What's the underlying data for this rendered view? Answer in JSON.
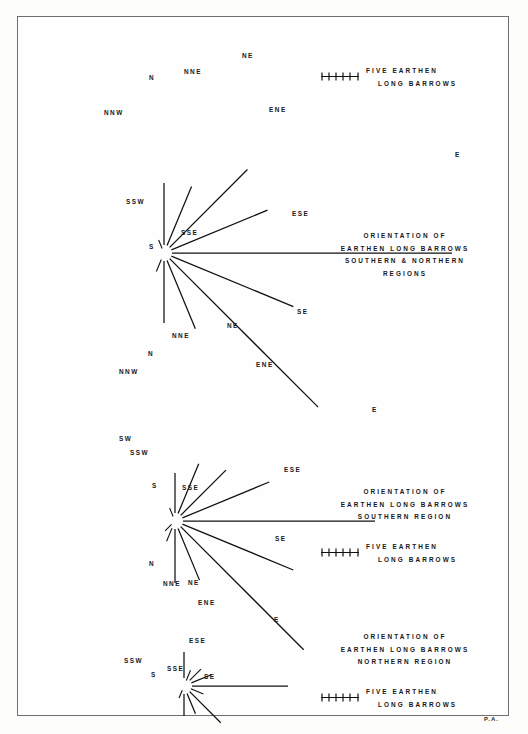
{
  "figure": {
    "signature": "P.A.",
    "compass_order": [
      "NNW",
      "N",
      "NNE",
      "NE",
      "ENE",
      "E",
      "ESE",
      "SE",
      "SSE",
      "S",
      "SSW",
      "SW"
    ]
  },
  "legend_scale": {
    "ticks": 6,
    "line1": "FIVE  EARTHEN",
    "line2": "LONG BARROWS"
  },
  "panels": [
    {
      "id": "combined",
      "title_lines": [
        "ORIENTATION  OF",
        "EARTHEN  LONG  BARROWS",
        "SOUTHERN  &  NORTHERN",
        "REGIONS"
      ],
      "labels": [
        "NNW",
        "N",
        "NNE",
        "NE",
        "ENE",
        "E",
        "ESE",
        "SE",
        "SSE",
        "S",
        "SSW"
      ],
      "rays": [
        {
          "label": "NNW",
          "azimuth": -22.5,
          "length": 14
        },
        {
          "label": "N",
          "azimuth": 0,
          "length": 70
        },
        {
          "label": "NNE",
          "azimuth": 22.5,
          "length": 72
        },
        {
          "label": "NE",
          "azimuth": 45,
          "length": 118
        },
        {
          "label": "ENE",
          "azimuth": 67.5,
          "length": 112
        },
        {
          "label": "E",
          "azimuth": 90,
          "length": 288
        },
        {
          "label": "ESE",
          "azimuth": 112.5,
          "length": 140
        },
        {
          "label": "SE",
          "azimuth": 135,
          "length": 218
        },
        {
          "label": "SSE",
          "azimuth": 157.5,
          "length": 82
        },
        {
          "label": "S",
          "azimuth": 180,
          "length": 70
        },
        {
          "label": "SSW",
          "azimuth": 202.5,
          "length": 20
        }
      ]
    },
    {
      "id": "southern",
      "title_lines": [
        "ORIENTATION  OF",
        "EARTHEN  LONG  BARROWS",
        "SOUTHERN  REGION"
      ],
      "labels": [
        "NNW",
        "N",
        "NNE",
        "NE",
        "ENE",
        "E",
        "ESE",
        "SE",
        "SSE",
        "S",
        "SSW",
        "SW"
      ],
      "rays": [
        {
          "label": "NNW",
          "azimuth": -22.5,
          "length": 14
        },
        {
          "label": "N",
          "azimuth": 0,
          "length": 48
        },
        {
          "label": "NNE",
          "azimuth": 22.5,
          "length": 62
        },
        {
          "label": "NE",
          "azimuth": 45,
          "length": 72
        },
        {
          "label": "ENE",
          "azimuth": 67.5,
          "length": 102
        },
        {
          "label": "E",
          "azimuth": 90,
          "length": 200
        },
        {
          "label": "ESE",
          "azimuth": 112.5,
          "length": 128
        },
        {
          "label": "SE",
          "azimuth": 135,
          "length": 182
        },
        {
          "label": "SSE",
          "azimuth": 157.5,
          "length": 64
        },
        {
          "label": "S",
          "azimuth": 180,
          "length": 62
        },
        {
          "label": "SSW",
          "azimuth": 202.5,
          "length": 22
        },
        {
          "label": "SW",
          "azimuth": 225,
          "length": 14
        }
      ]
    },
    {
      "id": "northern",
      "title_lines": [
        "ORIENTATION  OF",
        "EARTHEN  LONG  BARROWS",
        "NORTHERN  REGION"
      ],
      "labels": [
        "N",
        "NNE",
        "NE",
        "ENE",
        "E",
        "ESE",
        "SE",
        "SSE",
        "S",
        "SSW"
      ],
      "rays": [
        {
          "label": "N",
          "azimuth": 0,
          "length": 34
        },
        {
          "label": "NNE",
          "azimuth": 22.5,
          "length": 17
        },
        {
          "label": "NE",
          "azimuth": 45,
          "length": 24
        },
        {
          "label": "ENE",
          "azimuth": 67.5,
          "length": 30
        },
        {
          "label": "E",
          "azimuth": 90,
          "length": 104
        },
        {
          "label": "ESE",
          "azimuth": 112.5,
          "length": 21
        },
        {
          "label": "SE",
          "azimuth": 135,
          "length": 52
        },
        {
          "label": "SSE",
          "azimuth": 157.5,
          "length": 30
        },
        {
          "label": "S",
          "azimuth": 180,
          "length": 30
        },
        {
          "label": "SSW",
          "azimuth": 202.5,
          "length": 13
        }
      ]
    }
  ],
  "text": {
    "p1_title1": "ORIENTATION  OF",
    "p1_title2": "EARTHEN  LONG  BARROWS",
    "p1_title3": "SOUTHERN  &  NORTHERN",
    "p1_title4": "REGIONS",
    "p2_title1": "ORIENTATION  OF",
    "p2_title2": "EARTHEN  LONG  BARROWS",
    "p2_title3": "SOUTHERN  REGION",
    "p3_title1": "ORIENTATION  OF",
    "p3_title2": "EARTHEN  LONG  BARROWS",
    "p3_title3": "NORTHERN  REGION",
    "leg1a": "FIVE  EARTHEN",
    "leg1b": "LONG BARROWS",
    "leg2a": "FIVE  EARTHEN",
    "leg2b": "LONG BARROWS",
    "leg3a": "FIVE  EARTHEN",
    "leg3b": "LONG BARROWS",
    "n": "N",
    "nne": "NNE",
    "ne": "NE",
    "ene": "ENE",
    "e": "E",
    "ese": "ESE",
    "se": "SE",
    "sse": "SSE",
    "s": "S",
    "ssw": "SSW",
    "sw": "SW",
    "nnw": "NNW",
    "signature": "P.A."
  }
}
